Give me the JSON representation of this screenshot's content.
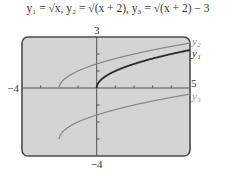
{
  "chart_data": {
    "type": "line",
    "title_parts": {
      "y1": "y₁ = √x,",
      "y2": "y₂ = √(x + 2),",
      "y3": "y₃ = √(x + 2) − 3"
    },
    "xlim": [
      -4,
      5
    ],
    "ylim": [
      -4,
      3
    ],
    "xtick_step": 1,
    "ytick_step": 1,
    "axis_labels": {
      "xmin": "−4",
      "xmax": "5",
      "ymin": "−4",
      "ymax": "3"
    },
    "grid": false,
    "legend_position": "right, inline labels",
    "series": [
      {
        "name": "y₂",
        "expr": "sqrt(x+2)",
        "domain": [
          -2,
          5
        ],
        "color": "#8a8a8a",
        "x": [
          -2,
          -1,
          0,
          1,
          2,
          3,
          4,
          5
        ],
        "values": [
          0,
          1,
          1.41,
          1.73,
          2,
          2.24,
          2.45,
          2.65
        ]
      },
      {
        "name": "y₁",
        "expr": "sqrt(x)",
        "domain": [
          0,
          5
        ],
        "color": "#2a2a2a",
        "x": [
          0,
          1,
          2,
          3,
          4,
          5
        ],
        "values": [
          0,
          1,
          1.41,
          1.73,
          2,
          2.24
        ]
      },
      {
        "name": "y₃",
        "expr": "sqrt(x+2)-3",
        "domain": [
          -2,
          5
        ],
        "color": "#8a8a8a",
        "x": [
          -2,
          -1,
          0,
          1,
          2,
          3,
          4,
          5
        ],
        "values": [
          -3,
          -2,
          -1.59,
          -1.27,
          -1,
          -0.76,
          -0.55,
          -0.35
        ]
      }
    ]
  },
  "colors": {
    "screen_bg": "#d4d4d4",
    "frame": "#4a4a4a",
    "axis": "#555555"
  }
}
